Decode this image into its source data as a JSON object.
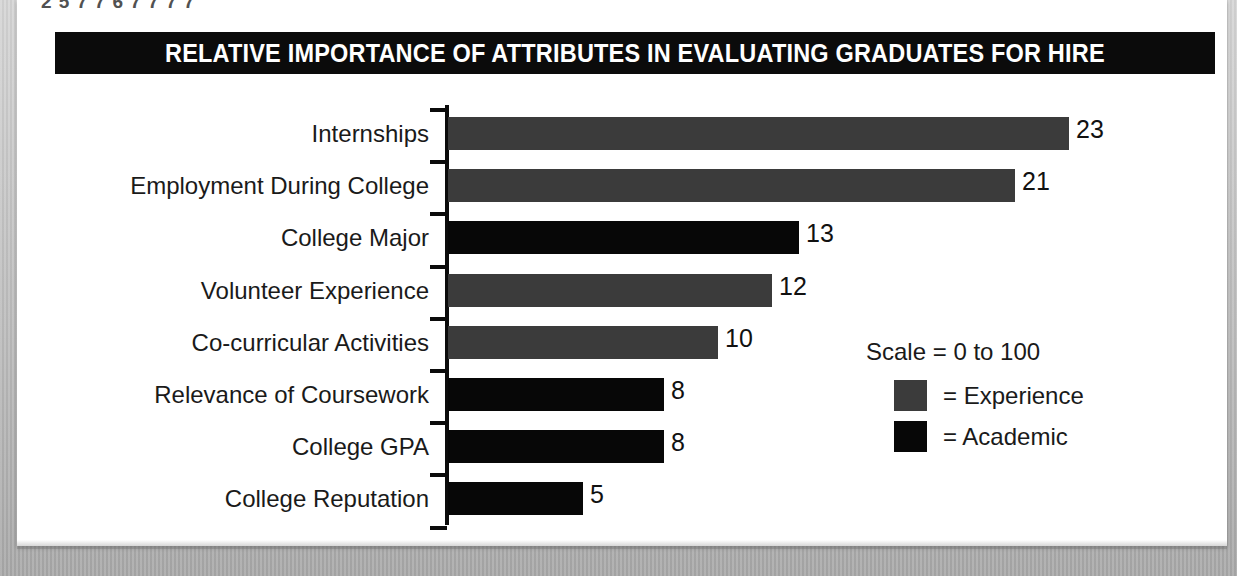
{
  "page": {
    "top_fragment_text": "2 5 7 7 6  7 7 7 7"
  },
  "chart": {
    "title": "RELATIVE IMPORTANCE OF ATTRIBUTES IN EVALUATING GRADUATES FOR HIRE"
  },
  "legend": {
    "scale_note": "Scale = 0 to 100",
    "items": [
      {
        "label": "= Experience",
        "key": "experience",
        "color": "#3b3b3b"
      },
      {
        "label": "= Academic",
        "key": "academic",
        "color": "#070707"
      }
    ]
  },
  "chart_data": {
    "type": "bar",
    "orientation": "horizontal",
    "title": "RELATIVE IMPORTANCE OF ATTRIBUTES IN EVALUATING GRADUATES FOR HIRE",
    "xlabel": "",
    "ylabel": "",
    "scale_note": "Scale = 0 to 100",
    "xlim": [
      0,
      100
    ],
    "grid": false,
    "legend_position": "right-middle",
    "legend": [
      "= Experience",
      "= Academic"
    ],
    "colors": {
      "experience": "#3b3b3b",
      "academic": "#070707"
    },
    "categories": [
      "Internships",
      "Employment During College",
      "College Major",
      "Volunteer Experience",
      "Co-curricular Activities",
      "Relevance of Coursework",
      "College GPA",
      "College Reputation"
    ],
    "values": [
      23,
      21,
      13,
      12,
      10,
      8,
      8,
      5
    ],
    "groups": [
      "experience",
      "experience",
      "academic",
      "experience",
      "experience",
      "academic",
      "academic",
      "academic"
    ],
    "bars": [
      {
        "label": "Internships",
        "value": 23,
        "group": "experience",
        "value_label": "23"
      },
      {
        "label": "Employment During College",
        "value": 21,
        "group": "experience",
        "value_label": "21"
      },
      {
        "label": "College Major",
        "value": 13,
        "group": "academic",
        "value_label": "13"
      },
      {
        "label": "Volunteer Experience",
        "value": 12,
        "group": "experience",
        "value_label": "12"
      },
      {
        "label": "Co-curricular Activities",
        "value": 10,
        "group": "experience",
        "value_label": "10"
      },
      {
        "label": "Relevance of Coursework",
        "value": 8,
        "group": "academic",
        "value_label": "8"
      },
      {
        "label": "College GPA",
        "value": 8,
        "group": "academic",
        "value_label": "8"
      },
      {
        "label": "College Reputation",
        "value": 5,
        "group": "academic",
        "value_label": "5"
      }
    ]
  }
}
